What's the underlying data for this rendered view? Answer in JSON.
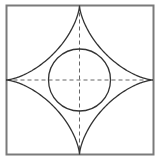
{
  "diagram": {
    "title": "",
    "frame": {
      "x": 6.5,
      "y": 5.5,
      "width": 147,
      "height": 149,
      "stroke": "#7a7a7a",
      "stroke_width": 2
    },
    "center": {
      "x": 79.5,
      "y": 80
    },
    "circle": {
      "r": 31,
      "stroke": "#333333",
      "stroke_width": 1.3
    },
    "astroid": {
      "cusps": [
        {
          "name": "top",
          "x": 79.5,
          "y": 5.5
        },
        {
          "name": "right",
          "x": 153.5,
          "y": 80
        },
        {
          "name": "bottom",
          "x": 79.5,
          "y": 154.5
        },
        {
          "name": "left",
          "x": 6.5,
          "y": 80
        }
      ],
      "stroke": "#333333",
      "stroke_width": 1.3
    },
    "axes": {
      "stroke": "#666666",
      "dash": "4 3",
      "stroke_width": 1
    },
    "colors": {
      "background": "#ffffff",
      "line": "#333333",
      "frame": "#7a7a7a",
      "dashed": "#666666"
    }
  }
}
